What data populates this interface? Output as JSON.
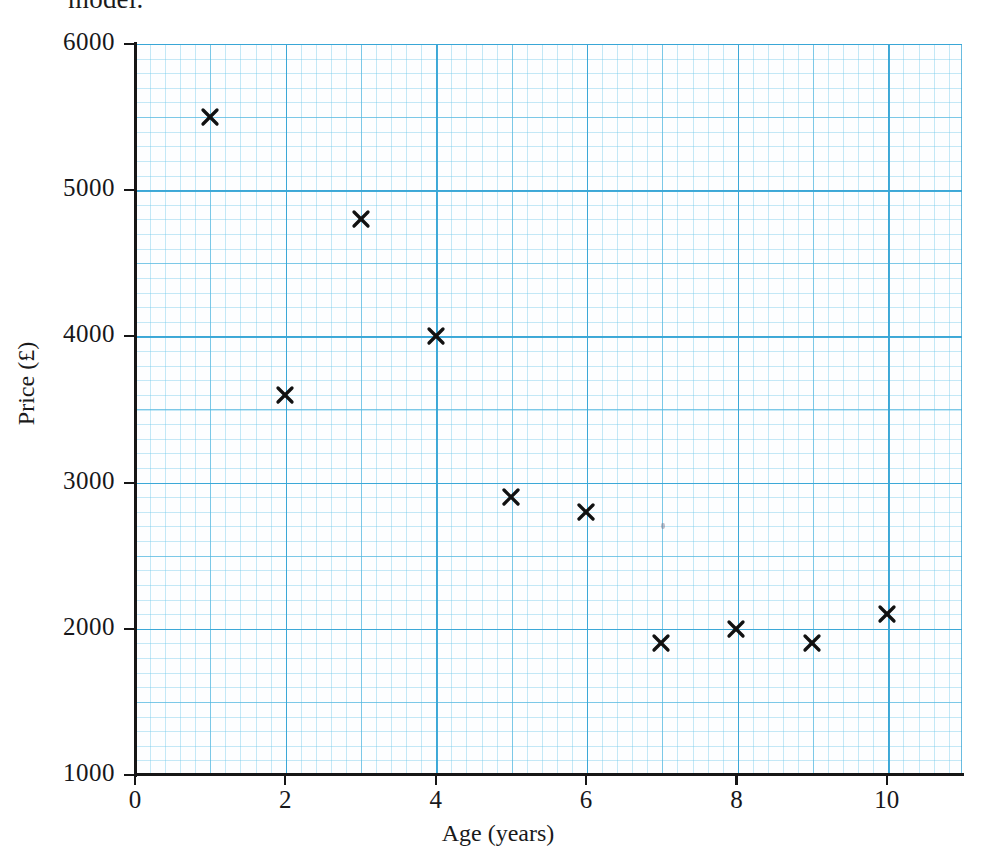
{
  "page": {
    "cutoff_text": "model.",
    "background_color": "#ffffff"
  },
  "chart_data": {
    "type": "scatter",
    "title": "",
    "xlabel": "Age (years)",
    "ylabel": "Price (£)",
    "xlim": [
      0,
      11
    ],
    "ylim": [
      1000,
      6000
    ],
    "xticks": [
      0,
      2,
      4,
      6,
      8,
      10
    ],
    "xtick_labels": [
      "0",
      "2",
      "4",
      "6",
      "8",
      "10"
    ],
    "yticks": [
      1000,
      2000,
      3000,
      4000,
      5000,
      6000
    ],
    "ytick_labels": [
      "1000",
      "2000",
      "3000",
      "4000",
      "5000",
      "6000"
    ],
    "grid": true,
    "grid_color": "#38a6d6",
    "legend": false,
    "marker": "x",
    "marker_color": "#111111",
    "x": [
      1,
      2,
      3,
      4,
      5,
      6,
      7,
      8,
      9,
      10
    ],
    "y": [
      5500,
      3600,
      4800,
      4000,
      2900,
      2800,
      1900,
      2000,
      1900,
      2100
    ],
    "points": [
      {
        "x": 1,
        "y": 5500
      },
      {
        "x": 2,
        "y": 3600
      },
      {
        "x": 3,
        "y": 4800
      },
      {
        "x": 4,
        "y": 4000
      },
      {
        "x": 5,
        "y": 2900
      },
      {
        "x": 6,
        "y": 2800
      },
      {
        "x": 7,
        "y": 1900
      },
      {
        "x": 8,
        "y": 2000
      },
      {
        "x": 9,
        "y": 1900
      },
      {
        "x": 10,
        "y": 2100
      }
    ]
  }
}
